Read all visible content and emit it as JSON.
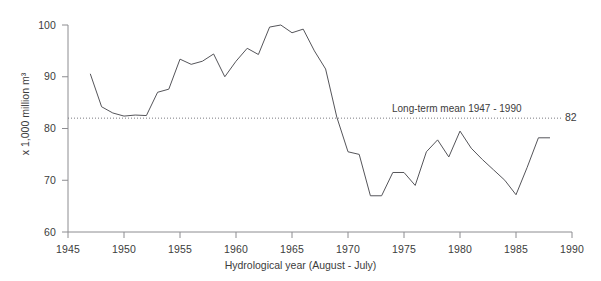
{
  "chart_data": {
    "type": "line",
    "title": "",
    "xlabel": "Hydrological year (August - July)",
    "ylabel": "x 1,000 million m³",
    "xlim": [
      1945,
      1990
    ],
    "ylim": [
      60,
      100
    ],
    "xticks": [
      1945,
      1950,
      1955,
      1960,
      1965,
      1970,
      1975,
      1980,
      1985,
      1990
    ],
    "yticks": [
      60,
      70,
      80,
      90,
      100
    ],
    "grid": false,
    "legend": "none",
    "x": [
      1947,
      1948,
      1949,
      1950,
      1951,
      1952,
      1953,
      1954,
      1955,
      1956,
      1957,
      1958,
      1959,
      1960,
      1961,
      1962,
      1963,
      1964,
      1965,
      1966,
      1967,
      1968,
      1969,
      1970,
      1971,
      1972,
      1973,
      1974,
      1975,
      1976,
      1977,
      1978,
      1979,
      1980,
      1981,
      1982,
      1983,
      1984,
      1985,
      1986,
      1987,
      1988
    ],
    "values": [
      90.5,
      84.2,
      83.0,
      82.4,
      82.6,
      82.5,
      87.0,
      87.6,
      93.4,
      92.4,
      93.0,
      94.4,
      90.0,
      93.0,
      95.5,
      94.3,
      99.6,
      100.0,
      98.5,
      99.2,
      95.0,
      91.5,
      82.2,
      75.5,
      75.0,
      67.0,
      67.0,
      71.5,
      71.5,
      69.0,
      75.5,
      77.8,
      74.5,
      79.5,
      76.2,
      74.0,
      72.0,
      70.0,
      67.2,
      72.5,
      78.2,
      78.2
    ],
    "series_name": "Annual flow",
    "line_color": "#55555a",
    "annotations": [
      {
        "name": "long-term-mean-line",
        "label": "Long-term mean 1947 - 1990",
        "value": 82,
        "value_label": "82",
        "style": "dotted",
        "color": "#7a7a80"
      }
    ]
  }
}
